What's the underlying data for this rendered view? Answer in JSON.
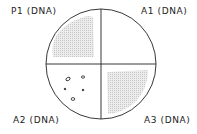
{
  "labels": {
    "top_left": "P1 (DNA)",
    "top_right": "A1 (DNA)",
    "bottom_left": "A2 (DNA)",
    "bottom_right": "A3 (DNA)"
  },
  "plate": {
    "quadrants": [
      {
        "name": "P1",
        "growth": "confluent"
      },
      {
        "name": "A1",
        "growth": "none"
      },
      {
        "name": "A2",
        "growth": "isolated colonies"
      },
      {
        "name": "A3",
        "growth": "confluent"
      }
    ]
  }
}
